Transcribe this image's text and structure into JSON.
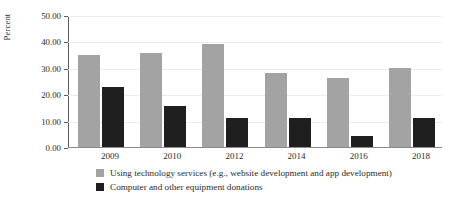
{
  "chart_data": {
    "type": "bar",
    "title": "",
    "subtitle": "",
    "xlabel": "",
    "ylabel": "Percent",
    "categories": [
      "2009",
      "2010",
      "2012",
      "2014",
      "2016",
      "2018"
    ],
    "series": [
      {
        "name": "Using technology services (e.g., website development and app development)",
        "color": "#a3a3a3",
        "values": [
          34.8,
          35.5,
          39.0,
          28.0,
          26.0,
          30.0
        ]
      },
      {
        "name": "Computer and other equipment donations",
        "color": "#1f1f1f",
        "values": [
          22.8,
          15.5,
          11.0,
          11.0,
          4.2,
          11.0
        ]
      }
    ],
    "ylim": [
      0,
      50
    ],
    "ytick_values": [
      0,
      10,
      20,
      30,
      40,
      50
    ],
    "ytick_labels": [
      "0.00",
      "10.00",
      "20.00",
      "30.00",
      "40.00",
      "50.00"
    ],
    "grid": true,
    "grid_axis": "y",
    "legend_position": "bottom-left",
    "legend": [
      {
        "label": "Using technology services (e.g., website development and app development)",
        "color": "#a3a3a3"
      },
      {
        "label": "Computer and other equipment donations",
        "color": "#1f1f1f"
      }
    ]
  }
}
